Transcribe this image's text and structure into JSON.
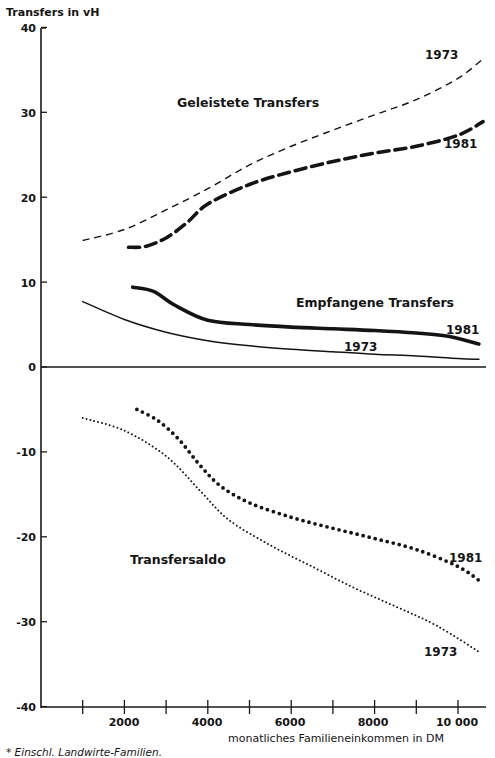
{
  "chart_data": {
    "type": "line",
    "title": "",
    "ylabel": "Transfers in vH",
    "xlabel": "monatliches Familieneinkommen in DM",
    "footnote": "* Einschl. Landwirte-Familien.",
    "ylim": [
      -40,
      40
    ],
    "xlim": [
      0,
      10700
    ],
    "yticks": [
      40,
      30,
      20,
      10,
      0,
      -10,
      -20,
      -30,
      -40
    ],
    "xticks": [
      1000,
      2000,
      3000,
      4000,
      5000,
      6000,
      7000,
      8000,
      9000,
      10000
    ],
    "xtick_labels": [
      "2000",
      "4000",
      "6000",
      "8000",
      "10000"
    ],
    "grid": false,
    "legend": "inline labels",
    "group_labels": [
      "Geleistete Transfers",
      "Empfangene Transfers",
      "Transfersaldo"
    ],
    "series": [
      {
        "name": "Geleistete Transfers 1973",
        "style": "thin-dashed",
        "x": [
          1000,
          2000,
          3000,
          4000,
          5000,
          6000,
          7000,
          8000,
          9000,
          10000,
          10600
        ],
        "y": [
          14.9,
          16.2,
          18.5,
          21.0,
          23.8,
          26.0,
          27.9,
          29.7,
          31.5,
          34.0,
          36.3
        ]
      },
      {
        "name": "Geleistete Transfers 1981",
        "style": "thick-dashed",
        "x": [
          2100,
          2500,
          3000,
          3500,
          4000,
          5000,
          6000,
          7000,
          8000,
          9000,
          10000,
          10600
        ],
        "y": [
          14.1,
          14.2,
          15.2,
          17.0,
          19.2,
          21.5,
          23.0,
          24.2,
          25.2,
          26.0,
          27.3,
          28.9
        ]
      },
      {
        "name": "Empfangene Transfers 1981",
        "style": "thick-solid",
        "x": [
          2200,
          2700,
          3200,
          4000,
          5000,
          6000,
          7000,
          8000,
          9000,
          9800,
          10500
        ],
        "y": [
          9.4,
          8.9,
          7.3,
          5.5,
          5.0,
          4.7,
          4.5,
          4.3,
          4.0,
          3.6,
          2.7
        ]
      },
      {
        "name": "Empfangene Transfers 1973",
        "style": "thin-solid",
        "x": [
          1000,
          2000,
          3000,
          4000,
          5000,
          6000,
          7000,
          8000,
          9000,
          10000,
          10500
        ],
        "y": [
          7.7,
          5.6,
          4.1,
          3.1,
          2.5,
          2.1,
          1.8,
          1.5,
          1.3,
          1.0,
          0.9
        ]
      },
      {
        "name": "Transfersaldo 1981",
        "style": "big-dots",
        "x": [
          2300,
          2800,
          3300,
          3800,
          4300,
          5000,
          6000,
          7000,
          8000,
          9000,
          10000,
          10550
        ],
        "y": [
          -5.0,
          -6.3,
          -8.5,
          -11.5,
          -14.0,
          -16.0,
          -17.7,
          -19.0,
          -20.2,
          -21.5,
          -23.5,
          -25.3
        ]
      },
      {
        "name": "Transfersaldo 1973",
        "style": "small-dots",
        "x": [
          1000,
          2000,
          3000,
          3800,
          4500,
          5500,
          6500,
          7500,
          8500,
          9500,
          10550
        ],
        "y": [
          -6.0,
          -7.5,
          -10.5,
          -14.5,
          -18.0,
          -21.0,
          -23.5,
          -26.0,
          -28.2,
          -30.5,
          -33.7
        ]
      }
    ],
    "annotations": [
      {
        "text": "1973",
        "near": "Geleistete Transfers 1973"
      },
      {
        "text": "1981",
        "near": "Geleistete Transfers 1981"
      },
      {
        "text": "1981",
        "near": "Empfangene Transfers 1981"
      },
      {
        "text": "1973",
        "near": "Empfangene Transfers 1973"
      },
      {
        "text": "1981",
        "near": "Transfersaldo 1981"
      },
      {
        "text": "1973",
        "near": "Transfersaldo 1973"
      }
    ]
  },
  "labels": {
    "ytitle": "Transfers in vH",
    "yticks": [
      "40",
      "30",
      "20",
      "10",
      "0",
      "-10",
      "-20",
      "-30",
      "-40"
    ],
    "xticks": [
      "2000",
      "4000",
      "6000",
      "8000",
      "10 000"
    ],
    "xtitle": "monatliches Familieneinkommen in DM",
    "footnote": "* Einschl. Landwirte-Familien.",
    "geleistete": "Geleistete Transfers",
    "empfangene": "Empfangene Transfers",
    "saldo": "Transfersaldo",
    "y1973": "1973",
    "y1981": "1981"
  }
}
